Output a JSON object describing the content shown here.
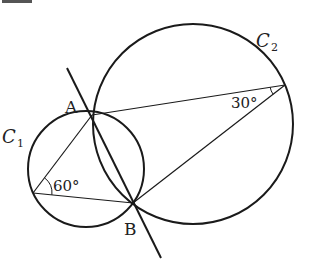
{
  "diagram": {
    "labels": {
      "circle1": "C",
      "circle1_sub": "1",
      "circle2": "C",
      "circle2_sub": "2",
      "pointA": "A",
      "pointB": "B",
      "angle1": "60°",
      "angle2": "30°"
    },
    "colors": {
      "stroke": "#1a1a1a",
      "text": "#222222",
      "background": "#ffffff"
    }
  }
}
